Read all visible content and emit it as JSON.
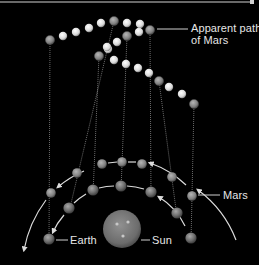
{
  "labels": {
    "apparent_path_line1": "Apparent path",
    "apparent_path_line2": "of Mars",
    "mars": "Mars",
    "earth": "Earth",
    "sun": "Sun"
  },
  "colors": {
    "background": "#000000",
    "text": "#e6e6e6",
    "orbit_arrow": "#dcdcdc",
    "sight_line": "#9a9a9a",
    "white_ball": "#f2f2f2",
    "mars_ball": "#8a8a8a",
    "earth_ball": "#7d7d7d",
    "sun": "#7a7a7a",
    "top_border": "#8c8c8c"
  },
  "sky_path": {
    "mars_positions": [
      [
        50,
        40
      ],
      [
        114,
        21
      ],
      [
        99,
        56
      ],
      [
        127,
        36
      ],
      [
        150,
        30
      ],
      [
        159,
        81
      ],
      [
        194,
        104
      ]
    ],
    "intermediate_positions": [
      [
        63,
        36
      ],
      [
        76,
        32
      ],
      [
        89,
        28
      ],
      [
        101,
        23
      ],
      [
        127,
        23
      ],
      [
        140,
        24
      ],
      [
        139,
        32
      ],
      [
        117,
        42
      ],
      [
        108,
        49
      ],
      [
        107,
        47
      ],
      [
        114,
        60
      ],
      [
        126,
        64
      ],
      [
        138,
        68
      ],
      [
        149,
        73
      ],
      [
        169,
        87
      ],
      [
        182,
        94
      ]
    ]
  },
  "orbits": {
    "sun": {
      "cx": 122,
      "cy": 229,
      "r": 19
    },
    "mars_orbit_positions": [
      [
        51,
        193
      ],
      [
        77,
        173
      ],
      [
        102,
        164
      ],
      [
        122,
        162
      ],
      [
        142,
        164
      ],
      [
        172,
        177
      ],
      [
        192,
        196
      ]
    ],
    "earth_orbit_positions": [
      [
        49,
        239
      ],
      [
        69,
        208
      ],
      [
        93,
        190
      ],
      [
        121,
        186
      ],
      [
        151,
        192
      ],
      [
        177,
        213
      ],
      [
        191,
        238
      ]
    ]
  }
}
